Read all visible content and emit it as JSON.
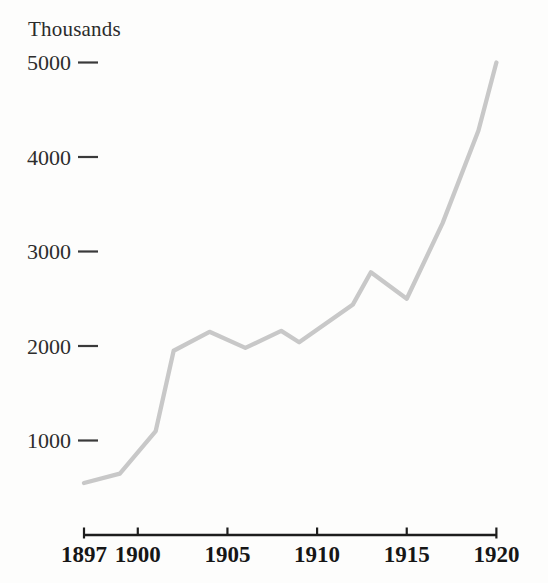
{
  "figure": {
    "unit_label": "Thousands"
  },
  "chart_data": {
    "type": "line",
    "title": "",
    "xlabel": "",
    "ylabel": "Thousands",
    "xlim": [
      1897,
      1920
    ],
    "ylim": [
      0,
      5000
    ],
    "grid": false,
    "legend": "none",
    "x_ticks": [
      {
        "year": 1897,
        "label": "1897"
      },
      {
        "year": 1900,
        "label": "1900"
      },
      {
        "year": 1905,
        "label": "1905"
      },
      {
        "year": 1910,
        "label": "1910"
      },
      {
        "year": 1915,
        "label": "1915"
      },
      {
        "year": 1920,
        "label": "1920"
      }
    ],
    "y_ticks": [
      {
        "value": 1000,
        "label": "1000"
      },
      {
        "value": 2000,
        "label": "2000"
      },
      {
        "value": 3000,
        "label": "3000"
      },
      {
        "value": 4000,
        "label": "4000"
      },
      {
        "value": 5000,
        "label": "5000"
      }
    ],
    "series": [
      {
        "name": "value-thousands",
        "color": "#c8c8c8",
        "points": [
          [
            1897,
            550
          ],
          [
            1899,
            650
          ],
          [
            1901,
            1100
          ],
          [
            1902,
            1950
          ],
          [
            1904,
            2150
          ],
          [
            1906,
            1980
          ],
          [
            1908,
            2160
          ],
          [
            1909,
            2040
          ],
          [
            1912,
            2440
          ],
          [
            1913,
            2780
          ],
          [
            1915,
            2500
          ],
          [
            1917,
            3300
          ],
          [
            1919,
            4280
          ],
          [
            1920,
            5000
          ]
        ]
      }
    ],
    "colors": {
      "line": "#c8c8c8",
      "axis": "#1d1d1d",
      "tick_dash": "#3a3a3a",
      "x_label": "#161616",
      "y_label": "#2d2d2d",
      "background": "#fdfdfc"
    }
  }
}
